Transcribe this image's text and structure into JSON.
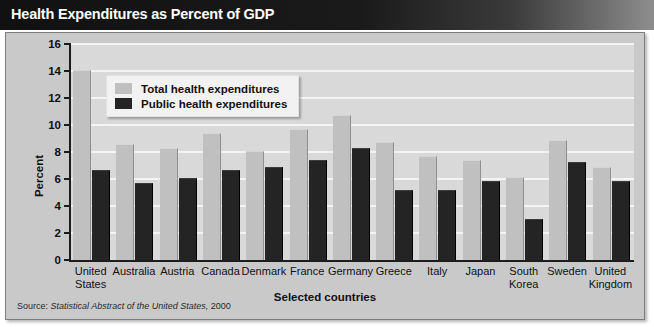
{
  "title": "Health Expenditures as Percent of GDP",
  "source": {
    "label": "Source:",
    "title": "Statistical Abstract of the United States,",
    "year": "2000"
  },
  "legend": {
    "position": "top-left-inside",
    "items": [
      {
        "label": "Total health expenditures",
        "color": "#c0c0c0",
        "key": "total"
      },
      {
        "label": "Public health expenditures",
        "color": "#242424",
        "key": "public"
      }
    ]
  },
  "chart_data": {
    "type": "bar",
    "title": "Health Expenditures as Percent of GDP",
    "xlabel": "Selected countries",
    "ylabel": "Percent",
    "ylim": [
      0,
      16
    ],
    "yticks": [
      0,
      2,
      4,
      6,
      8,
      10,
      12,
      14,
      16
    ],
    "grid": true,
    "grid_axis": "y",
    "categories": [
      "United States",
      "Australia",
      "Austria",
      "Canada",
      "Denmark",
      "France",
      "Germany",
      "Greece",
      "Italy",
      "Japan",
      "South Korea",
      "Sweden",
      "United Kingdom"
    ],
    "category_lines": [
      [
        "United",
        "States"
      ],
      [
        "Australia"
      ],
      [
        "Austria"
      ],
      [
        "Canada"
      ],
      [
        "Denmark"
      ],
      [
        "France"
      ],
      [
        "Germany"
      ],
      [
        "Greece"
      ],
      [
        "Italy"
      ],
      [
        "Japan"
      ],
      [
        "South",
        "Korea"
      ],
      [
        "Sweden"
      ],
      [
        "United",
        "Kingdom"
      ]
    ],
    "series": [
      {
        "name": "Total health expenditures",
        "color": "#c0c0c0",
        "values": [
          14.0,
          8.5,
          8.2,
          9.3,
          8.0,
          9.6,
          10.7,
          8.7,
          7.6,
          7.3,
          6.1,
          8.8,
          6.8
        ]
      },
      {
        "name": "Public health expenditures",
        "color": "#242424",
        "values": [
          6.6,
          5.6,
          6.0,
          6.6,
          6.8,
          7.3,
          8.2,
          5.1,
          5.1,
          5.8,
          3.0,
          7.2,
          5.8
        ]
      }
    ]
  }
}
